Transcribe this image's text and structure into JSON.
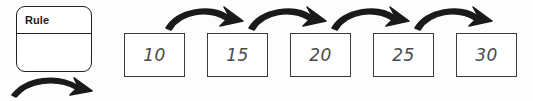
{
  "worksheet": {
    "rule_card": {
      "label": "Rule",
      "body_value": "",
      "icon": "rounded-rule-card"
    },
    "rule_arrow": {
      "icon": "curved-arrow-right"
    },
    "sequence": {
      "boxes": [
        {
          "value": "10",
          "left": 124
        },
        {
          "value": "15",
          "left": 207
        },
        {
          "value": "20",
          "left": 290
        },
        {
          "value": "25",
          "left": 373
        },
        {
          "value": "30",
          "left": 456
        }
      ],
      "arrows": [
        {
          "icon": "curved-arrow-right",
          "left": 163
        },
        {
          "icon": "curved-arrow-right",
          "left": 246
        },
        {
          "icon": "curved-arrow-right",
          "left": 329
        },
        {
          "icon": "curved-arrow-right",
          "left": 412
        }
      ]
    },
    "colors": {
      "ink": "#231f20",
      "box_border": "#3b3b3b",
      "number_text": "#4a4a4a",
      "background": "#fdfdfd"
    }
  }
}
